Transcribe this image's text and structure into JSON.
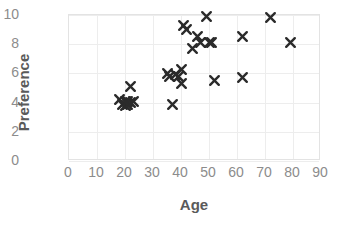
{
  "chart_data": {
    "type": "scatter",
    "title": "",
    "xlabel": "Age",
    "ylabel": "Preference",
    "xlim": [
      0,
      90
    ],
    "ylim": [
      0,
      10
    ],
    "xticks": [
      0,
      10,
      20,
      30,
      40,
      50,
      60,
      70,
      80,
      90
    ],
    "yticks": [
      0,
      2,
      4,
      6,
      8,
      10
    ],
    "grid": true,
    "legend": null,
    "marker": "x",
    "marker_color": "#2b2b2b",
    "series": [
      {
        "name": "Age vs Preference",
        "points": [
          {
            "x": 18,
            "y": 4.2
          },
          {
            "x": 19,
            "y": 3.9
          },
          {
            "x": 20,
            "y": 4.1
          },
          {
            "x": 20,
            "y": 3.8
          },
          {
            "x": 21,
            "y": 4.1
          },
          {
            "x": 21,
            "y": 3.9
          },
          {
            "x": 22,
            "y": 4.0
          },
          {
            "x": 22,
            "y": 5.1
          },
          {
            "x": 23,
            "y": 4.1
          },
          {
            "x": 35,
            "y": 6.0
          },
          {
            "x": 36,
            "y": 5.8
          },
          {
            "x": 37,
            "y": 3.9
          },
          {
            "x": 38,
            "y": 5.9
          },
          {
            "x": 39,
            "y": 5.8
          },
          {
            "x": 40,
            "y": 6.3
          },
          {
            "x": 40,
            "y": 5.3
          },
          {
            "x": 41,
            "y": 9.3
          },
          {
            "x": 42,
            "y": 9.0
          },
          {
            "x": 44,
            "y": 7.7
          },
          {
            "x": 46,
            "y": 8.5
          },
          {
            "x": 47,
            "y": 8.1
          },
          {
            "x": 49,
            "y": 9.9
          },
          {
            "x": 50,
            "y": 8.1
          },
          {
            "x": 51,
            "y": 8.1
          },
          {
            "x": 52,
            "y": 5.5
          },
          {
            "x": 62,
            "y": 8.5
          },
          {
            "x": 62,
            "y": 5.7
          },
          {
            "x": 72,
            "y": 9.8
          },
          {
            "x": 79,
            "y": 8.1
          }
        ]
      }
    ]
  },
  "axes": {
    "x_tick_labels": [
      "0",
      "10",
      "20",
      "30",
      "40",
      "50",
      "60",
      "70",
      "80",
      "90"
    ],
    "y_tick_labels": [
      "0",
      "2",
      "4",
      "6",
      "8",
      "10"
    ],
    "x_title": "Age",
    "y_title": "Preference"
  },
  "colors": {
    "marker": "#2b2b2b",
    "grid": "#ededed",
    "axis_border": "#e3e3e3",
    "tick_text": "#8c8c8c",
    "title_text": "#5a5a5a",
    "background": "#ffffff"
  }
}
